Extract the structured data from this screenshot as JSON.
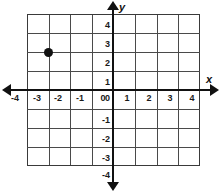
{
  "chart_data": {
    "type": "scatter",
    "title": "",
    "xlabel": "x",
    "ylabel": "y",
    "xlim": [
      -4,
      4
    ],
    "ylim": [
      -4,
      4
    ],
    "grid": true,
    "legend": false,
    "xticks": [
      "-4",
      "-3",
      "-2",
      "-1",
      "0",
      "1",
      "2",
      "3",
      "4"
    ],
    "yticks": [
      "4",
      "3",
      "2",
      "1",
      "0",
      "-1",
      "-2",
      "-3",
      "-4"
    ],
    "xtick_values": [
      -4,
      -3,
      -2,
      -1,
      0,
      1,
      2,
      3,
      4
    ],
    "ytick_values": [
      4,
      3,
      2,
      1,
      0,
      -1,
      -2,
      -3,
      -4
    ],
    "points": [
      {
        "x": -3,
        "y": 2,
        "label": "(-3, 2)",
        "color": "#111111"
      }
    ],
    "series": [
      {
        "name": "plotted-point",
        "x": [
          -3
        ],
        "y": [
          2
        ]
      }
    ],
    "colors": {
      "axis": "#111111",
      "grid": "#4a4a4a",
      "point": "#111111",
      "background": "#ffffff",
      "text": "#1a1a1a"
    }
  },
  "axes": {
    "x_name": "x",
    "y_name": "y"
  }
}
